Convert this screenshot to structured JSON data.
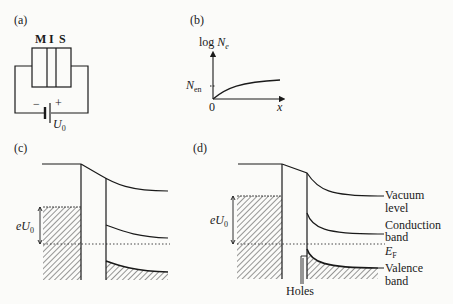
{
  "panels": {
    "a": {
      "label": "(a)",
      "layers": [
        "M",
        "I",
        "S"
      ],
      "battery_minus": "−",
      "battery_plus": "+",
      "voltage_label": "U",
      "voltage_sub": "0"
    },
    "b": {
      "label": "(b)",
      "y_axis_label": "log",
      "y_axis_var": "N",
      "y_axis_sub": "e",
      "tick_label": "N",
      "tick_sub": "en",
      "origin_label": "0",
      "x_axis_label": "x"
    },
    "c": {
      "label": "(c)",
      "energy_label": "eU",
      "energy_sub": "0"
    },
    "d": {
      "label": "(d)",
      "energy_label": "eU",
      "energy_sub": "0",
      "vacuum_label_1": "Vacuum",
      "vacuum_label_2": "level",
      "conduction_label_1": "Conduction",
      "conduction_label_2": "band",
      "fermi_label": "E",
      "fermi_sub": "F",
      "valence_label_1": "Valence",
      "valence_label_2": "band",
      "holes_label": "Holes"
    }
  },
  "colors": {
    "ink": "#1a1a1a",
    "paper": "#fbfbf9"
  }
}
